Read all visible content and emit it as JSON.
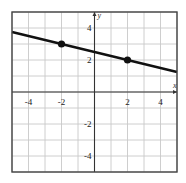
{
  "chart_data": {
    "type": "line",
    "title": "",
    "xlabel": "x",
    "ylabel": "y",
    "xlim": [
      -5,
      5
    ],
    "ylim": [
      -5,
      5
    ],
    "grid": true,
    "grid_step": 1,
    "x_ticks": [
      -4,
      -2,
      2,
      4
    ],
    "y_ticks": [
      4,
      2,
      -2,
      -4
    ],
    "x_tick_labels": [
      "-4",
      "-2",
      "2",
      "4"
    ],
    "y_tick_labels": [
      "4",
      "2",
      "-2",
      "-4"
    ],
    "series": [
      {
        "name": "line",
        "points": [
          {
            "x": -2,
            "y": 3
          },
          {
            "x": 2,
            "y": 2
          }
        ],
        "slope": -0.25,
        "intercept": 2.5,
        "extends_to_edges": true
      }
    ],
    "marked_points": [
      {
        "x": -2,
        "y": 3
      },
      {
        "x": 2,
        "y": 2
      }
    ],
    "colors": {
      "line": "#111111",
      "grid": "#c8c8c8",
      "axis": "#333333",
      "frame": "#444444"
    }
  }
}
